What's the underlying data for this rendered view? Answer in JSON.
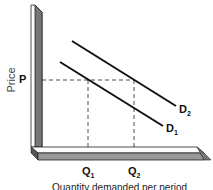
{
  "diagram": {
    "type": "demand-shift",
    "y_axis_label": "Price",
    "x_axis_label": "Quantity demanded per period",
    "price_marker": "P",
    "quantity_markers": [
      {
        "label": "Q",
        "sub": "1"
      },
      {
        "label": "Q",
        "sub": "2"
      }
    ],
    "curves": [
      {
        "label": "D",
        "sub": "1"
      },
      {
        "label": "D",
        "sub": "2"
      }
    ],
    "colors": {
      "axis_face": "#777777",
      "axis_edge": "#222222",
      "line": "#111111"
    }
  }
}
